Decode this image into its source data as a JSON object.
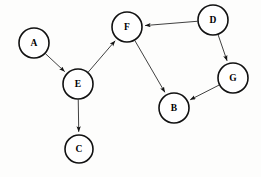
{
  "diagram": {
    "background_color": "#fdfdfc",
    "node_fill": "#ffffff",
    "node_stroke": "#111111",
    "edge_color": "#2b2b2b",
    "label_color": "#000000",
    "node_radius": 15,
    "nodes": [
      {
        "id": "A",
        "label": "A",
        "cx": 34,
        "cy": 43,
        "r": 15
      },
      {
        "id": "B",
        "label": "B",
        "cx": 174,
        "cy": 108,
        "r": 15
      },
      {
        "id": "C",
        "label": "C",
        "cx": 79,
        "cy": 149,
        "r": 14
      },
      {
        "id": "D",
        "label": "D",
        "cx": 213,
        "cy": 20,
        "r": 15
      },
      {
        "id": "E",
        "label": "E",
        "cx": 78,
        "cy": 84,
        "r": 15
      },
      {
        "id": "F",
        "label": "F",
        "cx": 127,
        "cy": 27,
        "r": 15
      },
      {
        "id": "G",
        "label": "G",
        "cx": 233,
        "cy": 78,
        "r": 15
      }
    ],
    "edges": [
      {
        "id": "A-E",
        "from": "A",
        "to": "E",
        "directed": true
      },
      {
        "id": "E-F",
        "from": "E",
        "to": "F",
        "directed": true
      },
      {
        "id": "E-C",
        "from": "E",
        "to": "C",
        "directed": true
      },
      {
        "id": "D-F",
        "from": "D",
        "to": "F",
        "directed": true
      },
      {
        "id": "D-G",
        "from": "D",
        "to": "G",
        "directed": true
      },
      {
        "id": "F-B",
        "from": "F",
        "to": "B",
        "directed": true
      },
      {
        "id": "G-B",
        "from": "G",
        "to": "B",
        "directed": true
      }
    ]
  }
}
